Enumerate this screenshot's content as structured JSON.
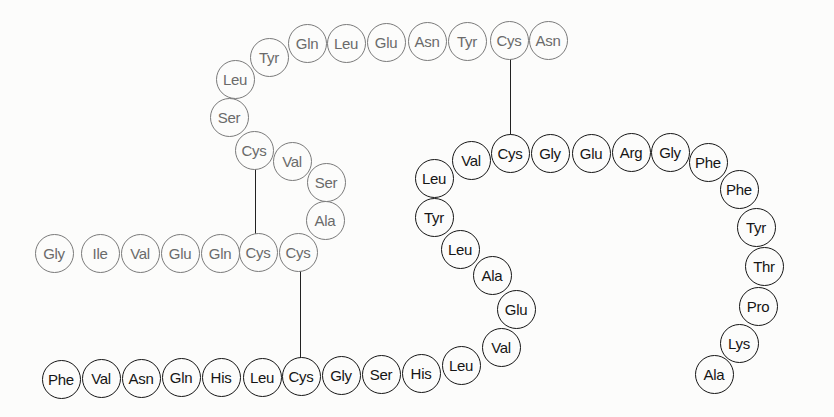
{
  "diagram": {
    "title": "",
    "colors": {
      "chain_a": "#6a6a6a",
      "chain_b": "#151515",
      "bond": "#222222",
      "background": "#fcfcfb"
    },
    "chain_a": [
      {
        "label": "Gly",
        "x": 54,
        "y": 253
      },
      {
        "label": "Ile",
        "x": 100,
        "y": 253
      },
      {
        "label": "Val",
        "x": 140,
        "y": 253
      },
      {
        "label": "Glu",
        "x": 180,
        "y": 253
      },
      {
        "label": "Gln",
        "x": 220,
        "y": 253
      },
      {
        "label": "Cys",
        "x": 258,
        "y": 252
      },
      {
        "label": "Cys",
        "x": 298,
        "y": 252
      },
      {
        "label": "Ala",
        "x": 325,
        "y": 220
      },
      {
        "label": "Ser",
        "x": 326,
        "y": 182
      },
      {
        "label": "Val",
        "x": 292,
        "y": 161
      },
      {
        "label": "Cys",
        "x": 254,
        "y": 150
      },
      {
        "label": "Ser",
        "x": 229,
        "y": 117
      },
      {
        "label": "Leu",
        "x": 235,
        "y": 79
      },
      {
        "label": "Tyr",
        "x": 269,
        "y": 57
      },
      {
        "label": "Gln",
        "x": 307,
        "y": 43
      },
      {
        "label": "Leu",
        "x": 346,
        "y": 43
      },
      {
        "label": "Glu",
        "x": 386,
        "y": 42
      },
      {
        "label": "Asn",
        "x": 427,
        "y": 41
      },
      {
        "label": "Tyr",
        "x": 467,
        "y": 41
      },
      {
        "label": "Cys",
        "x": 509,
        "y": 40
      },
      {
        "label": "Asn",
        "x": 548,
        "y": 40
      }
    ],
    "chain_b": [
      {
        "label": "Phe",
        "x": 61,
        "y": 379
      },
      {
        "label": "Val",
        "x": 101,
        "y": 378
      },
      {
        "label": "Asn",
        "x": 141,
        "y": 378
      },
      {
        "label": "Gln",
        "x": 181,
        "y": 377
      },
      {
        "label": "His",
        "x": 221,
        "y": 377
      },
      {
        "label": "Leu",
        "x": 262,
        "y": 377
      },
      {
        "label": "Cys",
        "x": 301,
        "y": 376
      },
      {
        "label": "Gly",
        "x": 341,
        "y": 375
      },
      {
        "label": "Ser",
        "x": 381,
        "y": 374
      },
      {
        "label": "His",
        "x": 421,
        "y": 373
      },
      {
        "label": "Leu",
        "x": 461,
        "y": 365
      },
      {
        "label": "Val",
        "x": 501,
        "y": 347
      },
      {
        "label": "Glu",
        "x": 516,
        "y": 309
      },
      {
        "label": "Ala",
        "x": 492,
        "y": 275
      },
      {
        "label": "Leu",
        "x": 460,
        "y": 249
      },
      {
        "label": "Tyr",
        "x": 434,
        "y": 217
      },
      {
        "label": "Leu",
        "x": 434,
        "y": 178
      },
      {
        "label": "Val",
        "x": 471,
        "y": 160
      },
      {
        "label": "Cys",
        "x": 510,
        "y": 153
      },
      {
        "label": "Gly",
        "x": 550,
        "y": 153
      },
      {
        "label": "Glu",
        "x": 591,
        "y": 153
      },
      {
        "label": "Arg",
        "x": 631,
        "y": 152
      },
      {
        "label": "Gly",
        "x": 670,
        "y": 152
      },
      {
        "label": "Phe",
        "x": 708,
        "y": 162
      },
      {
        "label": "Phe",
        "x": 739,
        "y": 189
      },
      {
        "label": "Tyr",
        "x": 756,
        "y": 227
      },
      {
        "label": "Thr",
        "x": 764,
        "y": 266
      },
      {
        "label": "Pro",
        "x": 758,
        "y": 306
      },
      {
        "label": "Lys",
        "x": 739,
        "y": 343
      },
      {
        "label": "Ala",
        "x": 714,
        "y": 374
      }
    ],
    "disulfide_bonds": [
      {
        "x": 255,
        "y1": 160,
        "y2": 242
      },
      {
        "x": 300,
        "y1": 262,
        "y2": 366
      },
      {
        "x": 510,
        "y1": 50,
        "y2": 143
      }
    ]
  }
}
